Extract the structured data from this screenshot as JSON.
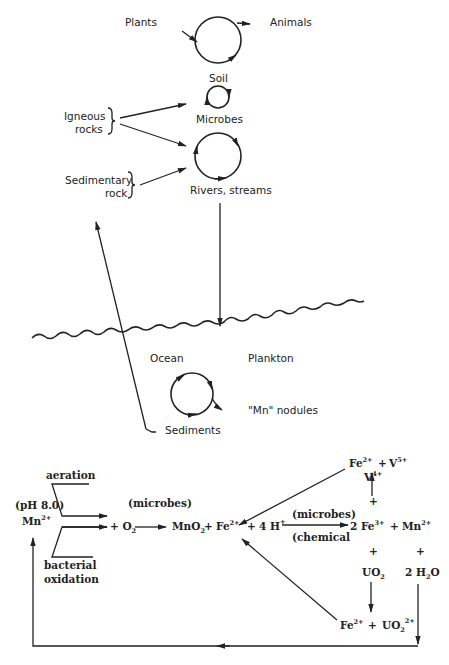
{
  "diagram": {
    "type": "biogeochemical-cycle",
    "upper_cycle": {
      "plants": "Plants",
      "animals": "Animals",
      "soil": "Soil",
      "microbes": "Microbes",
      "igneous_1": "Igneous",
      "igneous_2": "rocks",
      "sedimentary_1": "Sedimentary",
      "sedimentary_2": "rock",
      "rivers": "Rivers, streams",
      "ocean": "Ocean",
      "plankton": "Plankton",
      "nodules": "\"Mn\" nodules",
      "sediments": "Sediments"
    },
    "reactions": {
      "aeration": "aeration",
      "ph": "(pH 8.0)",
      "mn": "Mn",
      "mn_charge": "2+",
      "bacterial_1": "bacterial",
      "bacterial_2": "oxidation",
      "microbes_label": "(microbes)",
      "plus_o2": "+ O",
      "o2_sub": "2",
      "mno2": "MnO",
      "mno2_sub": "2",
      "plus": "+",
      "fe": "Fe",
      "fe2": "2+",
      "fe3": "3+",
      "four_h": "4 H",
      "h_charge": "+",
      "microbes_label_2": "(microbes)",
      "chemical_label": "(chemical",
      "two_fe": "2 Fe",
      "v5": "V",
      "v5_charge": "5+",
      "v4": "V",
      "v4_charge": "4+",
      "uo2": "UO",
      "uo2_sub": "2",
      "uo2_charge": "2+",
      "two_h2o_a": "2 H",
      "two_h2o_sub": "2",
      "two_h2o_b": "O"
    }
  }
}
